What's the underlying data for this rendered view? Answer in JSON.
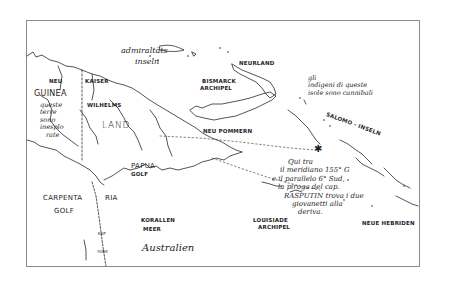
{
  "map": {
    "frame": {
      "border_color": "#8a8a8a"
    },
    "ink_color": "#1e1e1e",
    "labels": {
      "neu_guinea_1": "NEU",
      "neu_guinea_2": "GUINEA",
      "neu_guinea_note": [
        "queste",
        "terre",
        "sono",
        "inesplo",
        "rate"
      ],
      "kaiser": "KAISER",
      "wilhelms": "WILHELMS",
      "land": "LAND",
      "admiralitats_1": "admiraltäts",
      "admiralitats_2": "inseln",
      "bismarck_1": "BISMARCK",
      "bismarck_2": "ARCHIPEL",
      "neurland": "NEURLAND",
      "neu_pommern": "NEU POMMERN",
      "cannibals_note": [
        "gli",
        "indigeni di queste",
        "isole sono cannibali"
      ],
      "salomo": "SALOMO - INSELN",
      "papua_1": "PAPUA",
      "papua_2": "GOLF",
      "carpentaria_1": "CARPENTA",
      "carpentaria_2": "RIA",
      "carpentaria_golf": "GOLF",
      "kap": "KAP",
      "york": "YORK",
      "korallen_1": "KORALLEN",
      "korallen_2": "MEER",
      "australien": "Australien",
      "louisiade_1": "LOUISIADE",
      "louisiade_2": "ARCHIPEL",
      "neue_hebriden": "NEUE HEBRIDEN",
      "rasputin_note": [
        "Qui tra",
        "il meridiano 155° G",
        "e il parallelo 6° Sud,",
        "la piroga del cap.",
        "RASPUTIN trova i due",
        "giovanetti alla",
        "deriva."
      ]
    },
    "markers": [
      {
        "name": "piroga-location",
        "symbol": "✱",
        "meridian": "155°",
        "parallel": "6° Sud"
      }
    ]
  }
}
